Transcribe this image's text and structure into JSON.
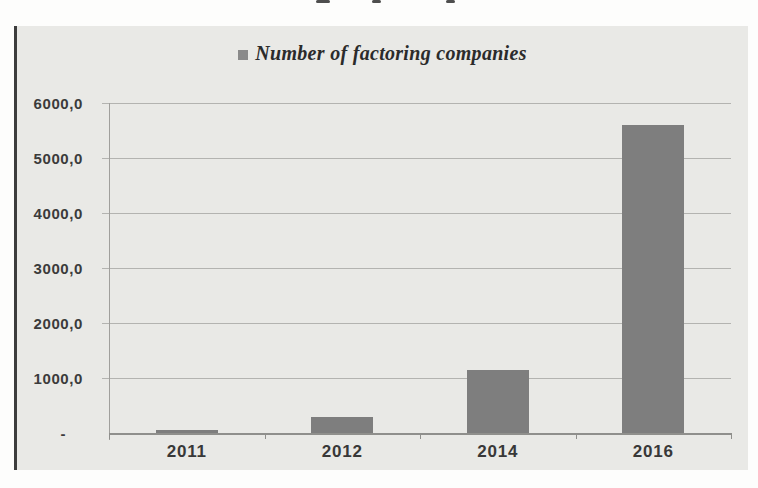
{
  "chart_data": {
    "type": "bar",
    "title": "",
    "legend": {
      "label": "Number of factoring companies",
      "position": "top-center",
      "marker_color": "#8a8a8a"
    },
    "categories": [
      "2011",
      "2012",
      "2014",
      "2016"
    ],
    "series": [
      {
        "name": "Number of factoring companies",
        "values": [
          50,
          300,
          1150,
          5600
        ]
      }
    ],
    "xlabel": "",
    "ylabel": "",
    "ylim": [
      0,
      6000
    ],
    "y_tick_step": 1000,
    "y_tick_labels_top_to_bottom": [
      "6000,0",
      "5000,0",
      "4000,0",
      "3000,0",
      "2000,0",
      "1000,0",
      "-"
    ],
    "zero_shown_as": "-",
    "grid": true,
    "bar_color": "#7e7e7e",
    "plot_background": "#e9e9e6",
    "colors": {
      "gridline": "#b3b3b0",
      "axis": "#8f8f8c",
      "tick_text": "#3b3b3b",
      "left_border": "#3d3d3d"
    }
  }
}
